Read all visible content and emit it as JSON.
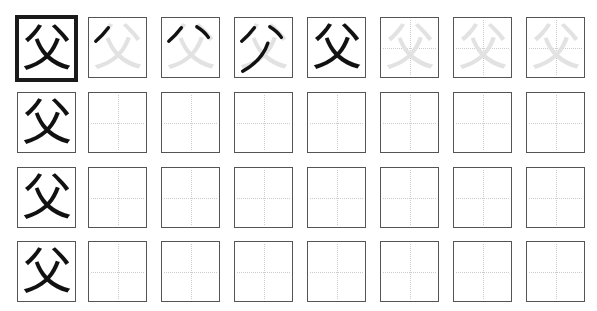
{
  "worksheet": {
    "character": "父",
    "model_cell": {
      "label": "model-character",
      "border": "thick"
    },
    "rows": [
      {
        "cells": [
          {
            "type": "model",
            "text": "父"
          },
          {
            "type": "stroke-order",
            "step": 1,
            "text": "父"
          },
          {
            "type": "stroke-order",
            "step": 2,
            "text": "父"
          },
          {
            "type": "stroke-order",
            "step": 3,
            "text": "父"
          },
          {
            "type": "stroke-order",
            "step": 4,
            "text": "父"
          },
          {
            "type": "trace",
            "text": "父"
          },
          {
            "type": "trace",
            "text": "父"
          },
          {
            "type": "trace",
            "text": "父"
          }
        ]
      },
      {
        "cells": [
          {
            "type": "reference",
            "text": "父"
          },
          {
            "type": "blank"
          },
          {
            "type": "blank"
          },
          {
            "type": "blank"
          },
          {
            "type": "blank"
          },
          {
            "type": "blank"
          },
          {
            "type": "blank"
          },
          {
            "type": "blank"
          }
        ]
      },
      {
        "cells": [
          {
            "type": "reference",
            "text": "父"
          },
          {
            "type": "blank"
          },
          {
            "type": "blank"
          },
          {
            "type": "blank"
          },
          {
            "type": "blank"
          },
          {
            "type": "blank"
          },
          {
            "type": "blank"
          },
          {
            "type": "blank"
          }
        ]
      },
      {
        "cells": [
          {
            "type": "reference",
            "text": "父"
          },
          {
            "type": "blank"
          },
          {
            "type": "blank"
          },
          {
            "type": "blank"
          },
          {
            "type": "blank"
          },
          {
            "type": "blank"
          },
          {
            "type": "blank"
          },
          {
            "type": "blank"
          }
        ]
      }
    ],
    "colors": {
      "ink": "#111111",
      "trace": "#e2e2e2",
      "border": "#555555",
      "guide": "#cccccc"
    }
  }
}
